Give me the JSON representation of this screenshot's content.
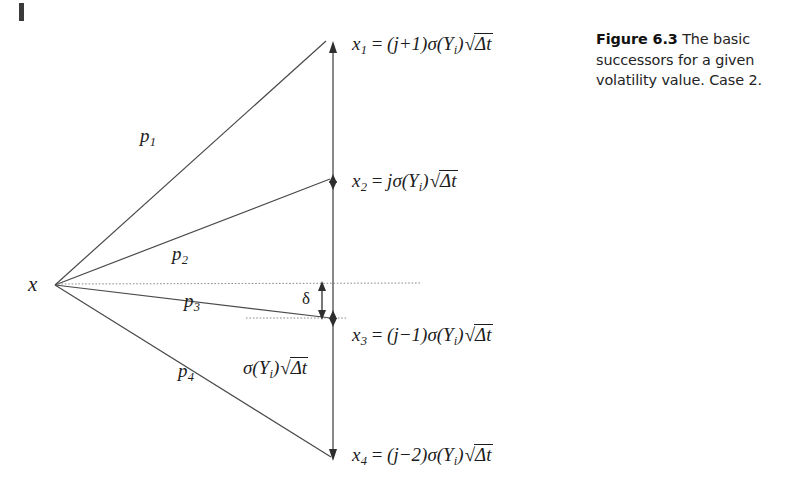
{
  "figure": {
    "caption_title": "Figure 6.3",
    "caption_text": "The basic successors for a given volatility value. Case 2.",
    "apex_label": "x",
    "delta_label": "δ",
    "corner_mark": "page-edge-mark"
  },
  "equations": {
    "x1": {
      "lhs": "x",
      "sub": "1",
      "rel": "=",
      "coef": "(j+1)",
      "sigma": "σ(Y",
      "sigma_sub": "i",
      "sigma_close": ")",
      "radical": "Δt"
    },
    "x2": {
      "lhs": "x",
      "sub": "2",
      "rel": "=",
      "coef": "j",
      "sigma": "σ(Y",
      "sigma_sub": "i",
      "sigma_close": ")",
      "radical": "Δt"
    },
    "x3": {
      "lhs": "x",
      "sub": "3",
      "rel": "=",
      "coef": "(j−1)",
      "sigma": "σ(Y",
      "sigma_sub": "i",
      "sigma_close": ")",
      "radical": "Δt"
    },
    "x4": {
      "lhs": "x",
      "sub": "4",
      "rel": "=",
      "coef": "(j−2)",
      "sigma": "σ(Y",
      "sigma_sub": "i",
      "sigma_close": ")",
      "radical": "Δt"
    },
    "spacing": {
      "lhs": "",
      "sub": "",
      "rel": "",
      "coef": "",
      "sigma": "σ(Y",
      "sigma_sub": "i",
      "sigma_close": ")",
      "radical": "Δt"
    }
  },
  "branches": [
    {
      "name": "p1",
      "label": "p",
      "sub": "1"
    },
    {
      "name": "p2",
      "label": "p",
      "sub": "2"
    },
    {
      "name": "p3",
      "label": "p",
      "sub": "3"
    },
    {
      "name": "p4",
      "label": "p",
      "sub": "4"
    }
  ],
  "colors": {
    "ink": "#1d1d1d",
    "line": "#4a4a4a",
    "dotted": "#7a7a7a",
    "background": "#ffffff",
    "caption": "#232323"
  },
  "geometry": {
    "apex": {
      "x": 55,
      "y": 285
    },
    "axis_x": 333,
    "axis_top_y": 44,
    "axis_bottom_y": 458,
    "markers": {
      "x1": 44,
      "x2": 181,
      "x3": 330,
      "x4": 458
    },
    "delta_top_y": 283,
    "delta_bottom_y": 318
  }
}
